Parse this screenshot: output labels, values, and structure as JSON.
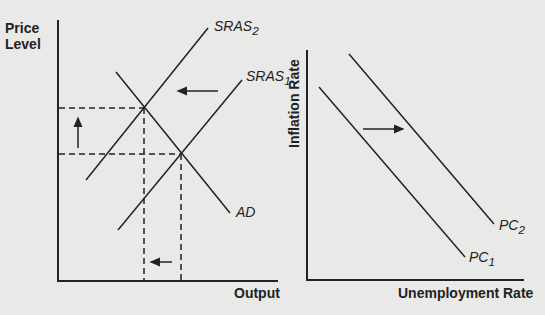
{
  "left_chart": {
    "y_label_line1": "Price",
    "y_label_line2": "Level",
    "x_label": "Output",
    "curves": {
      "sras2": {
        "base": "SRAS",
        "sub": "2"
      },
      "sras1": {
        "base": "SRAS",
        "sub": "1"
      },
      "ad": {
        "base": "AD",
        "sub": ""
      }
    }
  },
  "right_chart": {
    "y_label": "Inflation Rate",
    "x_label": "Unemployment Rate",
    "curves": {
      "pc2": {
        "base": "PC",
        "sub": "2"
      },
      "pc1": {
        "base": "PC",
        "sub": "1"
      }
    }
  },
  "colors": {
    "line": "#222222",
    "background": "#e9e9e7"
  }
}
